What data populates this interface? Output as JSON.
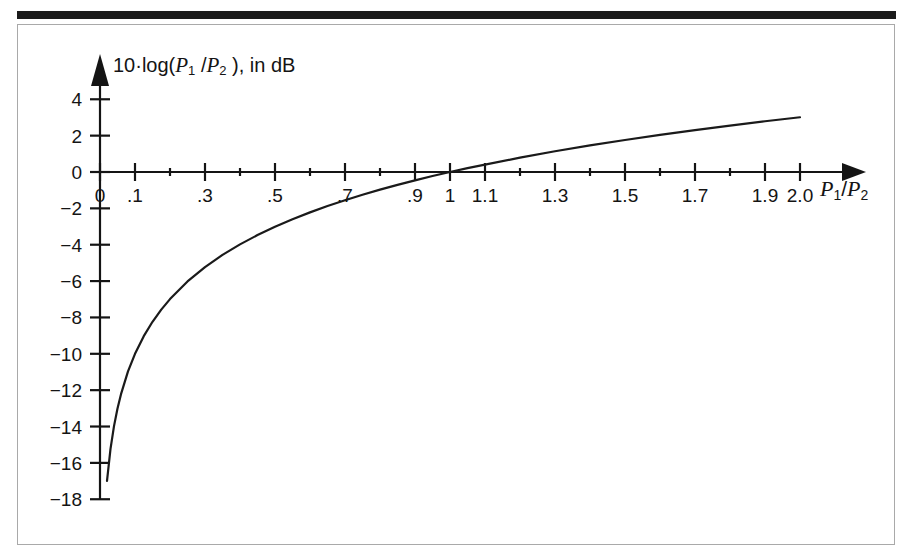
{
  "figure": {
    "background_color": "#ffffff",
    "frame_color": "#a9a9a9",
    "rule_color": "#1b1b1b",
    "curve_color": "#1a1a1a"
  },
  "chart_data": {
    "type": "line",
    "title": "",
    "subtitle": "",
    "ylabel": "10·log(P1 /P2 ), in dB",
    "ylabel_parts": {
      "prefix": "10",
      "dot": "·",
      "func": "log(",
      "p1": "P",
      "p1_sub": "1",
      "slash": " /",
      "p2": "P",
      "p2_sub": "2",
      "suffix": " ), in dB"
    },
    "xlabel": "P1/P2",
    "xlabel_parts": {
      "p1": "P",
      "p1_sub": "1",
      "slash": "/",
      "p2": "P",
      "p2_sub": "2"
    },
    "xlim": [
      0,
      2.0
    ],
    "ylim": [
      -18,
      5
    ],
    "grid": false,
    "legend": "none",
    "x_major_ticks": [
      0,
      0.1,
      0.3,
      0.5,
      0.7,
      0.9,
      1.0,
      1.1,
      1.3,
      1.5,
      1.7,
      1.9,
      2.0
    ],
    "x_minor_ticks": [
      0.2,
      0.4,
      0.6,
      0.8,
      1.2,
      1.4,
      1.6,
      1.8
    ],
    "x_tick_labels": [
      "0",
      ".1",
      ".3",
      ".5",
      ".7",
      ".9",
      "1",
      "1.1",
      "1.3",
      "1.5",
      "1.7",
      "1.9",
      "2.0"
    ],
    "y_ticks": [
      4,
      2,
      0,
      -2,
      -4,
      -6,
      -8,
      -10,
      -12,
      -14,
      -16,
      -18
    ],
    "y_tick_labels": [
      "4",
      "2",
      "0",
      "−2",
      "−4",
      "−6",
      "−8",
      "−10",
      "−12",
      "−14",
      "−16",
      "−18"
    ],
    "x_axis_origin_label": "0",
    "series": [
      {
        "name": "10·log(P1/P2)",
        "x": [
          0.02,
          0.03,
          0.04,
          0.05,
          0.06,
          0.08,
          0.1,
          0.125,
          0.15,
          0.175,
          0.2,
          0.25,
          0.3,
          0.35,
          0.4,
          0.45,
          0.5,
          0.55,
          0.6,
          0.65,
          0.7,
          0.75,
          0.8,
          0.85,
          0.9,
          0.95,
          1.0,
          1.05,
          1.1,
          1.2,
          1.3,
          1.4,
          1.5,
          1.6,
          1.7,
          1.8,
          1.9,
          2.0
        ],
        "y": [
          -16.99,
          -15.23,
          -13.98,
          -13.01,
          -12.22,
          -10.97,
          -10.0,
          -9.03,
          -8.24,
          -7.57,
          -6.99,
          -6.02,
          -5.23,
          -4.56,
          -3.98,
          -3.47,
          -3.01,
          -2.6,
          -2.22,
          -1.87,
          -1.55,
          -1.25,
          -0.97,
          -0.71,
          -0.46,
          -0.22,
          0.0,
          0.21,
          0.41,
          0.79,
          1.14,
          1.46,
          1.76,
          2.04,
          2.3,
          2.55,
          2.79,
          3.01
        ]
      }
    ]
  }
}
